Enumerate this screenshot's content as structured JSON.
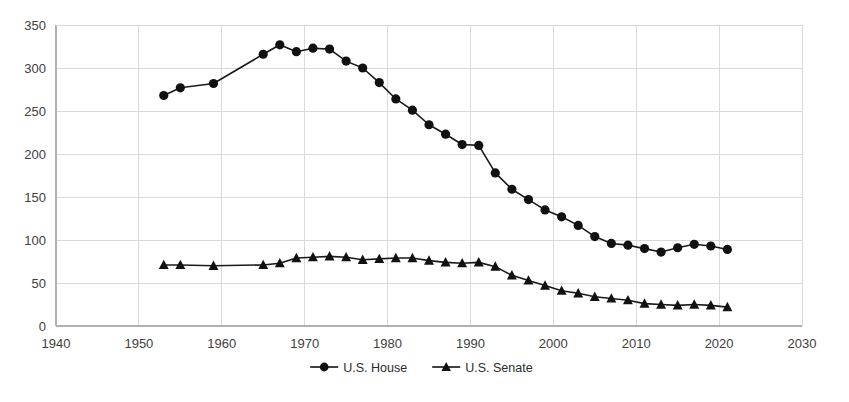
{
  "chart_data": {
    "type": "line",
    "title": "",
    "subtitle": "",
    "xlabel": "",
    "ylabel": "",
    "xlim": [
      1940,
      2030
    ],
    "ylim": [
      0,
      350
    ],
    "xticks": [
      1940,
      1950,
      1960,
      1970,
      1980,
      1990,
      2000,
      2010,
      2020,
      2030
    ],
    "yticks": [
      0,
      50,
      100,
      150,
      200,
      250,
      300,
      350
    ],
    "grid": true,
    "grid_axis": "y",
    "legend_position": "bottom",
    "x": [
      1953,
      1955,
      1959,
      1965,
      1967,
      1969,
      1971,
      1973,
      1975,
      1977,
      1979,
      1981,
      1983,
      1985,
      1987,
      1989,
      1991,
      1993,
      1995,
      1997,
      1999,
      2001,
      2003,
      2005,
      2007,
      2009,
      2011,
      2013,
      2015,
      2017,
      2019,
      2021
    ],
    "series": [
      {
        "name": "U.S. House",
        "marker": "circle",
        "color": "#111111",
        "values": [
          268,
          277,
          282,
          316,
          327,
          319,
          323,
          322,
          308,
          300,
          283,
          264,
          251,
          234,
          223,
          211,
          210,
          178,
          159,
          147,
          135,
          127,
          117,
          104,
          96,
          94,
          90,
          86,
          91,
          95,
          93,
          89
        ]
      },
      {
        "name": "U.S. Senate",
        "marker": "triangle",
        "color": "#111111",
        "values": [
          71,
          71,
          70,
          71,
          73,
          79,
          80,
          81,
          80,
          77,
          78,
          79,
          79,
          76,
          74,
          73,
          74,
          69,
          59,
          53,
          47,
          41,
          38,
          34,
          32,
          30,
          26,
          25,
          24,
          25,
          24,
          22
        ]
      }
    ],
    "legend": [
      {
        "label": "U.S. House",
        "marker": "circle"
      },
      {
        "label": "U.S. Senate",
        "marker": "triangle"
      }
    ]
  },
  "axis": {
    "y_tick_labels": [
      "350",
      "300",
      "250",
      "200",
      "150",
      "100",
      "50",
      "0"
    ],
    "x_tick_labels": [
      "1940",
      "1950",
      "1960",
      "1970",
      "1980",
      "1990",
      "2000",
      "2010",
      "2020",
      "2030"
    ]
  },
  "colors": {
    "background": "#ffffff",
    "grid": "#d9d9d9",
    "axis": "#b0b0b0",
    "series": "#111111",
    "tick_text": "#404040"
  }
}
